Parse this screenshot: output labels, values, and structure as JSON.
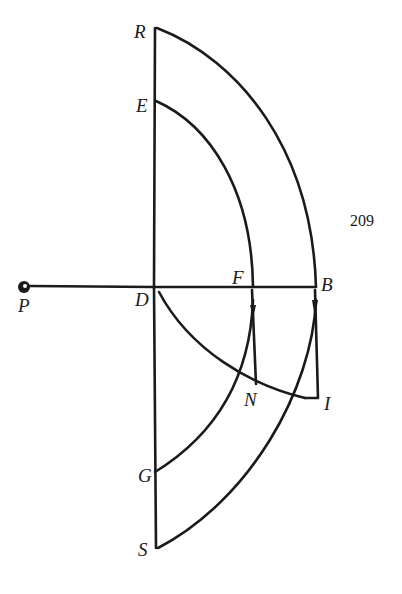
{
  "page_number": "209",
  "labels": {
    "R": "R",
    "E": "E",
    "F": "F",
    "B": "B",
    "P": "P",
    "D": "D",
    "N": "N",
    "I": "I",
    "G": "G",
    "S": "S"
  },
  "colors": {
    "ink": "#1a1a1a",
    "background": "#ffffff"
  }
}
